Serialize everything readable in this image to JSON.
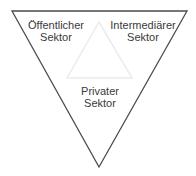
{
  "diagram": {
    "type": "inverted-triangle",
    "outer_triangle": {
      "points": [
        [
          12,
          11
        ],
        [
          187,
          11
        ],
        [
          99,
          167
        ]
      ],
      "stroke": "#4a4a4a"
    },
    "inner_triangle": {
      "points": [
        [
          99,
          22
        ],
        [
          132,
          78
        ],
        [
          67,
          78
        ]
      ],
      "stroke": "#ededed"
    },
    "labels": {
      "public": {
        "line1": "Öffentlicher",
        "line2": "Sektor"
      },
      "intermediary": {
        "line1": "Intermediärer",
        "line2": "Sektor"
      },
      "private": {
        "line1": "Privater",
        "line2": "Sektor"
      }
    }
  }
}
